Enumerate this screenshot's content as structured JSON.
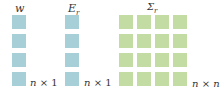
{
  "vectors": [
    {
      "name": "w",
      "dims": {
        "rows": "n",
        "times": "×",
        "cols": "1"
      },
      "color": "#a6cfd8",
      "cells": 4
    },
    {
      "name": "E",
      "subscript": "r",
      "dims": {
        "rows": "n",
        "times": "×",
        "cols": "1"
      },
      "color": "#a6cfd8",
      "cells": 4
    }
  ],
  "matrix": {
    "name": "Σ",
    "subscript": "r",
    "dims": {
      "rows": "n",
      "times": "×",
      "cols": "n"
    },
    "color": "#c3dca3",
    "rows": 4,
    "cols": 4
  }
}
